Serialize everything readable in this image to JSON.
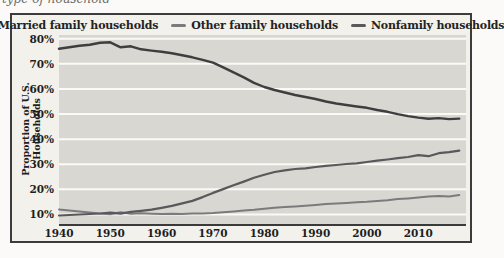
{
  "page": {
    "clipped_caption": "type of household"
  },
  "legend": [
    {
      "label": "Married family households",
      "color": "#3e3e40"
    },
    {
      "label": "Other family households",
      "color": "#7b7b7d"
    },
    {
      "label": "Nonfamily households",
      "color": "#59595b"
    }
  ],
  "colors": {
    "figure_background": "#f2f1ec",
    "plot_background": "#d8d7d2",
    "gridline": "#fafaf7",
    "axis_line": "#3a3a3a",
    "frame_border": "#3c3c3c",
    "text": "#1d1d1d"
  },
  "chart_data": {
    "type": "line",
    "title": "",
    "xlabel": "",
    "ylabel": "Proportion of U.S. Households",
    "grid": "horizontal",
    "legend_position": "top",
    "xlim": [
      1940,
      2019.3
    ],
    "ylim": [
      5.8,
      81.5
    ],
    "x_ticks": [
      {
        "value": 1940,
        "label": "1940"
      },
      {
        "value": 1950,
        "label": "1950"
      },
      {
        "value": 1960,
        "label": "1960"
      },
      {
        "value": 1970,
        "label": "1970"
      },
      {
        "value": 1980,
        "label": "1980"
      },
      {
        "value": 1990,
        "label": "1990"
      },
      {
        "value": 2000,
        "label": "2000"
      },
      {
        "value": 2010,
        "label": "2010"
      }
    ],
    "y_ticks": [
      {
        "value": 80,
        "label": "80%"
      },
      {
        "value": 70,
        "label": "70%"
      },
      {
        "value": 60,
        "label": "60%"
      },
      {
        "value": 50,
        "label": "50%"
      },
      {
        "value": 40,
        "label": "40%"
      },
      {
        "value": 30,
        "label": "30%"
      },
      {
        "value": 20,
        "label": "20%"
      },
      {
        "value": 10,
        "label": "10%"
      }
    ],
    "series": [
      {
        "name": "Married family households",
        "color": "#3e3e40",
        "width": 2.4,
        "x": [
          1940,
          1942,
          1944,
          1946,
          1948,
          1950,
          1952,
          1954,
          1956,
          1958,
          1960,
          1962,
          1964,
          1966,
          1968,
          1970,
          1972,
          1974,
          1976,
          1978,
          1980,
          1982,
          1984,
          1986,
          1988,
          1990,
          1992,
          1994,
          1996,
          1998,
          2000,
          2002,
          2004,
          2006,
          2008,
          2010,
          2012,
          2014,
          2016,
          2018
        ],
        "y": [
          76.0,
          76.6,
          77.2,
          77.6,
          78.4,
          78.6,
          76.6,
          77.0,
          75.8,
          75.3,
          74.8,
          74.2,
          73.4,
          72.6,
          71.6,
          70.5,
          68.6,
          66.6,
          64.6,
          62.4,
          60.8,
          59.6,
          58.6,
          57.6,
          56.8,
          56.0,
          55.0,
          54.2,
          53.6,
          53.0,
          52.5,
          51.6,
          50.9,
          50.0,
          49.2,
          48.6,
          48.1,
          48.4,
          48.0,
          48.2
        ]
      },
      {
        "name": "Other family households",
        "color": "#7b7b7d",
        "width": 2.0,
        "x": [
          1940,
          1942,
          1944,
          1946,
          1948,
          1950,
          1952,
          1954,
          1956,
          1958,
          1960,
          1962,
          1964,
          1966,
          1968,
          1970,
          1972,
          1974,
          1976,
          1978,
          1980,
          1982,
          1984,
          1986,
          1988,
          1990,
          1992,
          1994,
          1996,
          1998,
          2000,
          2002,
          2004,
          2006,
          2008,
          2010,
          2012,
          2014,
          2016,
          2018
        ],
        "y": [
          12.0,
          11.6,
          11.2,
          10.8,
          10.4,
          10.1,
          10.9,
          10.3,
          10.5,
          10.3,
          10.2,
          10.3,
          10.2,
          10.4,
          10.4,
          10.6,
          10.9,
          11.2,
          11.6,
          11.9,
          12.3,
          12.7,
          13.0,
          13.2,
          13.5,
          13.8,
          14.2,
          14.4,
          14.6,
          14.9,
          15.1,
          15.4,
          15.7,
          16.1,
          16.4,
          16.7,
          17.1,
          17.4,
          17.1,
          17.8
        ]
      },
      {
        "name": "Nonfamily households",
        "color": "#59595b",
        "width": 2.2,
        "x": [
          1940,
          1942,
          1944,
          1946,
          1948,
          1950,
          1952,
          1954,
          1956,
          1958,
          1960,
          1962,
          1964,
          1966,
          1968,
          1970,
          1972,
          1974,
          1976,
          1978,
          1980,
          1982,
          1984,
          1986,
          1988,
          1990,
          1992,
          1994,
          1996,
          1998,
          2000,
          2002,
          2004,
          2006,
          2008,
          2010,
          2012,
          2014,
          2016,
          2018
        ],
        "y": [
          9.6,
          9.8,
          10.0,
          10.2,
          10.4,
          10.7,
          10.3,
          11.0,
          11.4,
          11.9,
          12.6,
          13.4,
          14.4,
          15.4,
          16.9,
          18.6,
          20.1,
          21.6,
          23.1,
          24.6,
          25.8,
          26.9,
          27.6,
          28.1,
          28.4,
          28.9,
          29.4,
          29.7,
          30.1,
          30.4,
          30.9,
          31.4,
          31.9,
          32.4,
          32.9,
          33.6,
          33.2,
          34.4,
          34.8,
          35.4
        ]
      }
    ]
  }
}
